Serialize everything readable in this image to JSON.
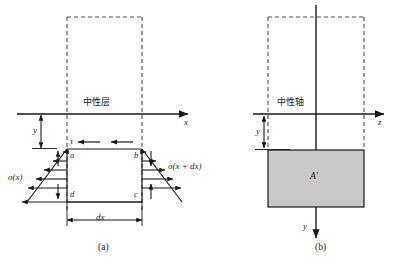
{
  "figure": {
    "panels": [
      {
        "id": "panel-a",
        "caption": "(a)",
        "axis_label_x": "x",
        "neutral_label": "中性层",
        "dim_y": "y",
        "dim_dx": "dx",
        "shear_label": "τ",
        "stress_left": "σ(x)",
        "stress_right": "σ(x + dx)",
        "corner_a": "a",
        "corner_b": "b",
        "corner_c": "c",
        "corner_d": "d"
      },
      {
        "id": "panel-b",
        "caption": "(b)",
        "axis_label_z": "z",
        "axis_label_y": "y",
        "neutral_label": "中性轴",
        "dim_y": "y",
        "area_label": "A'"
      }
    ],
    "colors": {
      "stroke": "#1a1a1a",
      "dashed": "#4d4d4d",
      "area_fill": "#c9c9c9",
      "background": "#ffffff"
    }
  }
}
